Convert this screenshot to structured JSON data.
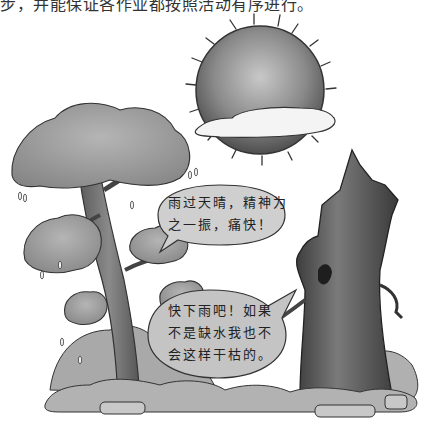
{
  "page": {
    "top_text_clipped": "步，并能保证各作业都按照活动有序进行。"
  },
  "illustration": {
    "sun": {
      "name": "sun-icon",
      "note": "sun partially covered by cloud"
    },
    "cloud": {
      "name": "cloud-icon"
    },
    "live_tree": {
      "name": "green-tree",
      "dripping_water": true
    },
    "dead_tree": {
      "name": "withered-tree-trunk"
    },
    "ground": {
      "name": "bushes-and-rocks"
    }
  },
  "bubbles": {
    "live_tree": {
      "lines": [
        "雨过天晴，精神为",
        "之一振，痛快！"
      ]
    },
    "dead_tree": {
      "lines": [
        "快下雨吧！如果",
        "不是缺水我也不",
        "会这样干枯的。"
      ]
    }
  },
  "colors": {
    "background": "#ffffff",
    "sun_dark": "#5a5a5a",
    "sun_light": "#bdbdbd",
    "foliage": "#9a9a9a",
    "trunk": "#6e6e6e",
    "dead_trunk": "#555555",
    "bubble_fill": "#c9c9c9",
    "outline": "#2a2a2a"
  }
}
